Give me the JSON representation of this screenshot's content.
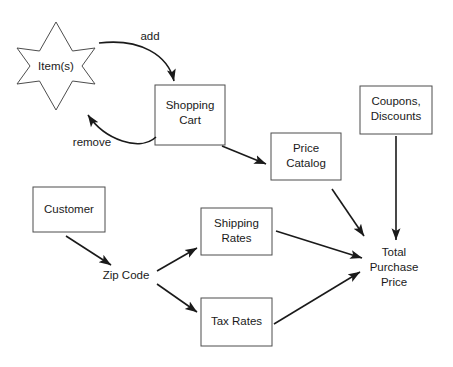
{
  "diagram": {
    "colors": {
      "background": "#ffffff",
      "box_stroke": "#4d4d4d",
      "arrow_stroke": "#1a1a1a",
      "text": "#1a1a1a"
    },
    "nodes": [
      {
        "id": "items",
        "shape": "star",
        "label": "Item(s)",
        "label_lines": [
          "Item(s)"
        ]
      },
      {
        "id": "shopping-cart",
        "shape": "rect",
        "label": "Shopping Cart",
        "label_lines": [
          "Shopping",
          "Cart"
        ]
      },
      {
        "id": "price-catalog",
        "shape": "rect",
        "label": "Price Catalog",
        "label_lines": [
          "Price",
          "Catalog"
        ]
      },
      {
        "id": "coupons-discounts",
        "shape": "rect",
        "label": "Coupons, Discounts",
        "label_lines": [
          "Coupons,",
          "Discounts"
        ]
      },
      {
        "id": "customer",
        "shape": "rect",
        "label": "Customer",
        "label_lines": [
          "Customer"
        ]
      },
      {
        "id": "shipping-rates",
        "shape": "rect",
        "label": "Shipping Rates",
        "label_lines": [
          "Shipping",
          "Rates"
        ]
      },
      {
        "id": "tax-rates",
        "shape": "rect",
        "label": "Tax Rates",
        "label_lines": [
          "Tax Rates"
        ]
      },
      {
        "id": "zip-code",
        "shape": "none",
        "label": "Zip Code",
        "label_lines": [
          "Zip Code"
        ]
      },
      {
        "id": "total-purchase-price",
        "shape": "none",
        "label": "Total Purchase Price",
        "label_lines": [
          "Total",
          "Purchase",
          "Price"
        ]
      }
    ],
    "edges": [
      {
        "id": "items-to-cart",
        "from": "items",
        "to": "shopping-cart",
        "label": "add",
        "style": "curved"
      },
      {
        "id": "cart-to-items",
        "from": "shopping-cart",
        "to": "items",
        "label": "remove",
        "style": "curved"
      },
      {
        "id": "cart-to-catalog",
        "from": "shopping-cart",
        "to": "price-catalog",
        "label": "",
        "style": "straight"
      },
      {
        "id": "catalog-to-total",
        "from": "price-catalog",
        "to": "total-purchase-price",
        "label": "",
        "style": "straight"
      },
      {
        "id": "coupons-to-total",
        "from": "coupons-discounts",
        "to": "total-purchase-price",
        "label": "",
        "style": "straight"
      },
      {
        "id": "customer-to-zip",
        "from": "customer",
        "to": "zip-code",
        "label": "",
        "style": "straight"
      },
      {
        "id": "zip-to-shipping",
        "from": "zip-code",
        "to": "shipping-rates",
        "label": "",
        "style": "straight"
      },
      {
        "id": "zip-to-tax",
        "from": "zip-code",
        "to": "tax-rates",
        "label": "",
        "style": "straight"
      },
      {
        "id": "shipping-to-total",
        "from": "shipping-rates",
        "to": "total-purchase-price",
        "label": "",
        "style": "straight"
      },
      {
        "id": "tax-to-total",
        "from": "tax-rates",
        "to": "total-purchase-price",
        "label": "",
        "style": "straight"
      }
    ],
    "edge_labels": {
      "add": "add",
      "remove": "remove"
    }
  }
}
